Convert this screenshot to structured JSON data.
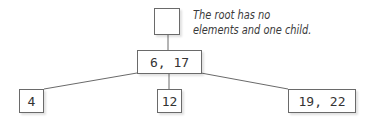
{
  "diagram": {
    "type": "tree",
    "annotation": {
      "line1": "The root has no",
      "line2": "elements and one child."
    },
    "nodes": {
      "root": {
        "label": ""
      },
      "middle": {
        "label": "6, 17"
      },
      "left": {
        "label": "4"
      },
      "center": {
        "label": "12"
      },
      "right": {
        "label": "19, 22"
      }
    },
    "edges": [
      [
        "root",
        "middle"
      ],
      [
        "middle",
        "left"
      ],
      [
        "middle",
        "center"
      ],
      [
        "middle",
        "right"
      ]
    ],
    "colors": {
      "line": "#6a6a6a",
      "text": "#333333",
      "background": "#ffffff"
    }
  }
}
